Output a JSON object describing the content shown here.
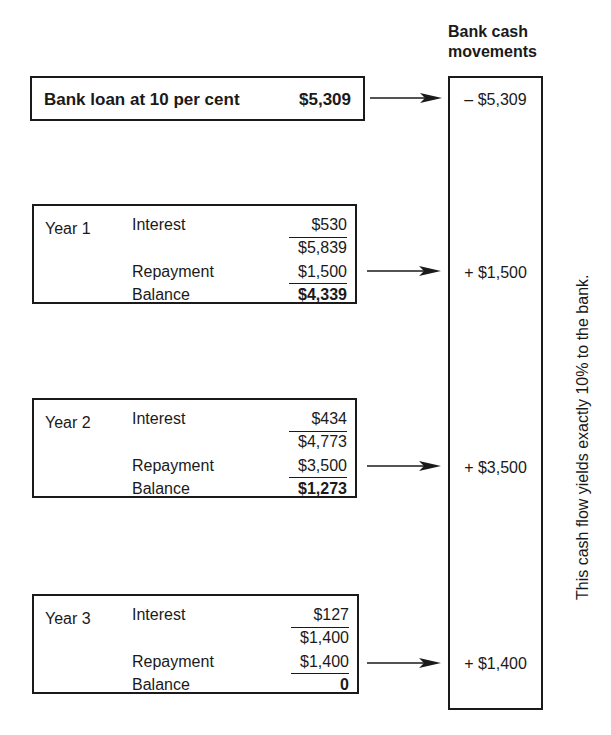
{
  "header": {
    "line1": "Bank cash",
    "line2": "movements"
  },
  "loan": {
    "label": "Bank loan at 10 per cent",
    "amount": "$5,309"
  },
  "years": [
    {
      "label": "Year 1",
      "interest_label": "Interest",
      "interest": "$530",
      "subtotal": "$5,839",
      "repayment_label": "Repayment",
      "repayment": "$1,500",
      "balance_label": "Balance",
      "balance": "$4,339"
    },
    {
      "label": "Year 2",
      "interest_label": "Interest",
      "interest": "$434",
      "subtotal": "$4,773",
      "repayment_label": "Repayment",
      "repayment": "$3,500",
      "balance_label": "Balance",
      "balance": "$1,273"
    },
    {
      "label": "Year 3",
      "interest_label": "Interest",
      "interest": "$127",
      "subtotal": "$1,400",
      "repayment_label": "Repayment",
      "repayment": "$1,400",
      "balance_label": "Balance",
      "balance": "0"
    }
  ],
  "cash_movements": [
    "– $5,309",
    "+ $1,500",
    "+ $3,500",
    "+ $1,400"
  ],
  "side_note": "This cash flow yields exactly 10% to the bank."
}
